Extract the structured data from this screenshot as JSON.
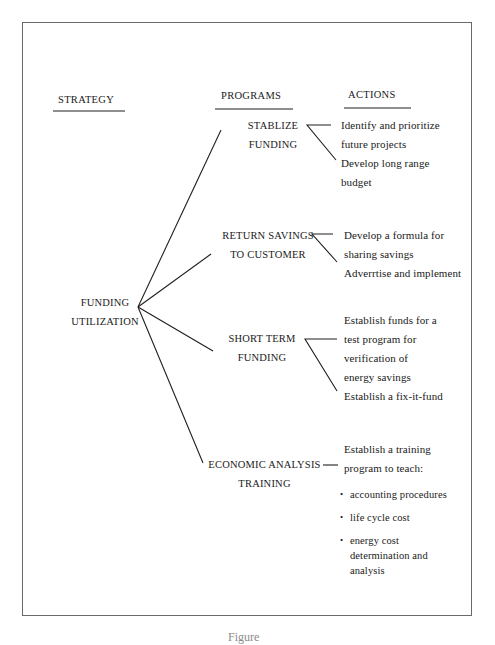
{
  "headers": {
    "strategy": "STRATEGY",
    "programs": "PROGRAMS",
    "actions": "ACTIONS"
  },
  "strategy": {
    "line1": "FUNDING",
    "line2": "UTILIZATION"
  },
  "programs": [
    {
      "line1": "STABLIZE",
      "line2": "FUNDING",
      "actions": [
        [
          "Identify and prioritize",
          "future projects"
        ],
        [
          "Develop long range",
          "budget"
        ]
      ]
    },
    {
      "line1": "RETURN SAVINGS",
      "line2": "TO CUSTOMER",
      "actions": [
        [
          "Develop a formula for",
          "sharing savings"
        ],
        [
          "Adverrtise and  implement"
        ]
      ]
    },
    {
      "line1": "SHORT TERM",
      "line2": "FUNDING",
      "actions": [
        [
          "Establish funds for a",
          "test program for",
          "verification of",
          "energy savings"
        ],
        [
          "Establish a fix-it-fund"
        ]
      ]
    },
    {
      "line1": "ECONOMIC ANALYSIS",
      "line2": "TRAINING",
      "intro": [
        "Establish a training",
        "program to teach:"
      ],
      "bullets": [
        [
          "accounting procedures"
        ],
        [
          "life cycle cost"
        ],
        [
          "energy cost",
          "determination and",
          "analysis"
        ]
      ]
    }
  ],
  "caption": "Figure"
}
